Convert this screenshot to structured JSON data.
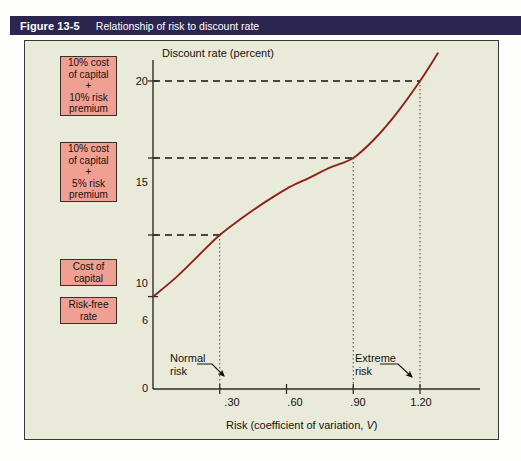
{
  "banner": {
    "figure_number": "Figure 13-5",
    "title": "Relationship of risk to discount rate",
    "background_color": "#2b2550",
    "text_color": "#ffffff"
  },
  "panel": {
    "background_color": "#e9eada",
    "border_color": "#3a3a34"
  },
  "callouts": [
    {
      "name": "10-percent-cost-plus-10-percent-risk",
      "lines": [
        "10% cost",
        "of capital",
        "+",
        "10% risk",
        "premium"
      ],
      "value": 20
    },
    {
      "name": "10-percent-cost-plus-5-percent-risk",
      "lines": [
        "10% cost",
        "of capital",
        "+",
        "5% risk",
        "premium"
      ],
      "value": 15
    },
    {
      "name": "cost-of-capital",
      "lines": [
        "Cost of",
        "capital"
      ],
      "value": 10
    },
    {
      "name": "risk-free-rate",
      "lines": [
        "Risk-free",
        "rate"
      ],
      "value": 6
    }
  ],
  "callout_style": {
    "fill": "#f0a093",
    "border": "#3a3028"
  },
  "chart_data": {
    "type": "line",
    "title": "Relationship of risk to discount rate",
    "xlabel": "Risk (coefficient of variation, V)",
    "ylabel": "Discount rate (percent)",
    "xlim": [
      0,
      1.35
    ],
    "ylim": [
      0,
      22.5
    ],
    "grid": false,
    "legend": "none",
    "line_color": "#8c2318",
    "xticks": [
      {
        "value": 0.3,
        "label": ".30"
      },
      {
        "value": 0.6,
        "label": ".60"
      },
      {
        "value": 0.9,
        "label": ".90"
      },
      {
        "value": 1.2,
        "label": "1.20"
      }
    ],
    "yticks": [
      {
        "value": 0,
        "label": "0"
      },
      {
        "value": 6,
        "label": "6"
      },
      {
        "value": 10,
        "label": "10"
      },
      {
        "value": 15,
        "label": "15"
      },
      {
        "value": 20,
        "label": "20"
      }
    ],
    "series": [
      {
        "name": "Risk-return (discount rate) curve",
        "x": [
          0.0,
          0.1,
          0.2,
          0.3,
          0.4,
          0.5,
          0.6,
          0.7,
          0.8,
          0.9,
          1.0,
          1.1,
          1.2,
          1.28
        ],
        "y": [
          6.0,
          7.2,
          8.6,
          10.0,
          11.1,
          12.1,
          13.0,
          13.7,
          14.4,
          15.0,
          16.3,
          18.0,
          20.0,
          21.8
        ]
      }
    ],
    "key_points": [
      {
        "x": 0.3,
        "y": 10,
        "label": "Cost of capital"
      },
      {
        "x": 0.9,
        "y": 15,
        "label": "10% cost of capital + 5% risk premium"
      },
      {
        "x": 1.2,
        "y": 20,
        "label": "10% cost of capital + 10% risk premium"
      },
      {
        "x": 0.0,
        "y": 6,
        "label": "Risk-free rate"
      }
    ],
    "guide_lines": [
      {
        "orientation": "horizontal",
        "value": 20,
        "style": "dashed"
      },
      {
        "orientation": "horizontal",
        "value": 15,
        "style": "dashed"
      },
      {
        "orientation": "horizontal",
        "value": 10,
        "style": "dashed"
      },
      {
        "orientation": "vertical",
        "value": 0.3,
        "style": "dotted"
      },
      {
        "orientation": "vertical",
        "value": 0.9,
        "style": "dotted"
      },
      {
        "orientation": "vertical",
        "value": 1.2,
        "style": "dotted"
      }
    ],
    "annotations": [
      {
        "name": "normal-risk",
        "lines": [
          "Normal",
          "risk"
        ],
        "points_to_x": 0.3
      },
      {
        "name": "extreme-risk",
        "lines": [
          "Extreme",
          "risk"
        ],
        "points_to_x": 1.2
      }
    ]
  }
}
